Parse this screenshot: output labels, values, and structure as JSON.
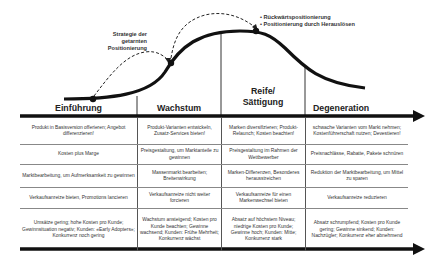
{
  "diagram": {
    "annotations": {
      "left": [
        "Strategie der",
        "getarnten",
        "Positionierung"
      ],
      "right": [
        "Rückwärtspositionierung",
        "Positionierung durch Herauslösen"
      ]
    },
    "phases": [
      {
        "label": "Einführung"
      },
      {
        "label": "Wachstum"
      },
      {
        "label": "Reife/ Sättigung",
        "line1": "Reife/",
        "line2": "Sättigung"
      },
      {
        "label": "Degeneration"
      }
    ],
    "rows": [
      {
        "topic": "Produkt",
        "cells": [
          "Produkt in Basisversion offerieren; Angebot differenzieren!",
          "Produkt-Varianten entwickeln, Zusatz-Services bieten!",
          "Marken diversifizieren; Produkt-Relaunch; Kosten beachten!",
          "schwache Varianten vom Markt nehmen; Kostenführerschaft nutzen; Devestieren!"
        ]
      },
      {
        "topic": "Preis",
        "cells": [
          "Kosten plus Marge",
          "Preisgestaltung, um Marktanteile zu gewinnen",
          "Preisgestaltung im Rahmen der Wettbewerber",
          "Preisnachlässe, Rabatte, Pakete schnüren"
        ]
      },
      {
        "topic": "Distribution",
        "cells": [
          "Marktbearbeitung, um Aufmerksamkeit zu gewinnen",
          "Massenmarkt bearbeiten; Breitenwirkung",
          "Marken-Differenzen, Besonderes herausstreichen",
          "Reduktion der Marktbearbeitung, um Mittel zu sparen"
        ]
      },
      {
        "topic": "Promotion",
        "cells": [
          "Verkaufsanreize bieten, Promotions lancieren",
          "Verkaufsanreize nicht weiter forcieren",
          "Verkaufsanreize für einen Markenwechsel bieten",
          "Verkaufsanreize reduzieren"
        ]
      },
      {
        "topic": "Markt",
        "cells": [
          "Umsätze gering; hohe Kosten pro Kunde; Gewinnsituation negativ; Kunden: «Early Adopters»; Konkurrenz noch gering",
          "Wachstum ansteigend; Kosten pro Kunde beachten; Gewinne wachsend; Kunden: Frühe Mehrheit; Konkurrenz wächst",
          "Absatz auf höchstem Niveau; niedrige Kosten pro Kunde; Gewinne hoch; Kunden: Mitte; Konkurrenz stark",
          "Absatz schrumpfend; Kosten pro Kunde gering; Gewinne sinkend; Kunden: Nachzügler; Konkurrenz eher abnehmend"
        ]
      }
    ],
    "colors": {
      "curve": "#111111",
      "axis": "#111111",
      "text": "#333333",
      "divider": "#888888"
    }
  }
}
